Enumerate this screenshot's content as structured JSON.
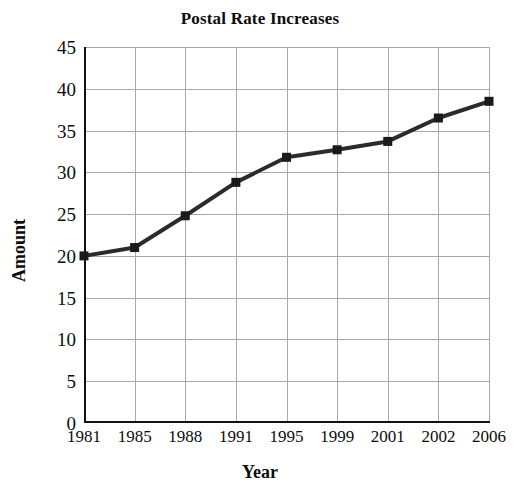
{
  "chart_data": {
    "type": "line",
    "title": "Postal Rate Increases",
    "xlabel": "Year",
    "ylabel": "Amount",
    "categories": [
      "1981",
      "1985",
      "1988",
      "1991",
      "1995",
      "1999",
      "2001",
      "2002",
      "2006"
    ],
    "values": [
      20,
      21,
      24.8,
      28.8,
      31.8,
      32.7,
      33.7,
      36.5,
      38.5
    ],
    "series": [
      {
        "name": "Postal Rate",
        "values": [
          20,
          21,
          24.8,
          28.8,
          31.8,
          32.7,
          33.7,
          36.5,
          38.5
        ]
      }
    ],
    "ylim": [
      0,
      45
    ],
    "yticks": [
      0,
      5,
      10,
      15,
      20,
      25,
      30,
      35,
      40,
      45
    ],
    "ytick_labels": [
      "0",
      "5",
      "10",
      "15",
      "20",
      "25",
      "30",
      "35",
      "40",
      "45"
    ],
    "xtick_labels": [
      "1981",
      "1985",
      "1988",
      "1991",
      "1995",
      "1999",
      "2001",
      "2002",
      "2006"
    ],
    "grid": true,
    "legend": "none",
    "marker": "square",
    "line_color": "#2b2b2b",
    "marker_color": "#1a1a1a",
    "grid_color": "#a8a8a8",
    "axis_color": "#111111",
    "background": "#ffffff"
  }
}
